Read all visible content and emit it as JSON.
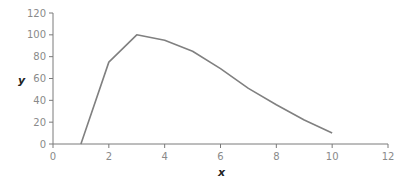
{
  "chart_data": {
    "type": "line",
    "title": "",
    "xlabel": "x",
    "ylabel": "y",
    "xlim": [
      0,
      12
    ],
    "ylim": [
      0,
      120
    ],
    "xticks": [
      0,
      2,
      4,
      6,
      8,
      10,
      12
    ],
    "yticks": [
      0,
      20,
      40,
      60,
      80,
      100,
      120
    ],
    "grid": false,
    "legend": null,
    "series": [
      {
        "name": "y",
        "color": "#808080",
        "x": [
          1,
          2,
          3,
          4,
          5,
          6,
          7,
          8,
          9,
          10
        ],
        "y": [
          0,
          75,
          100,
          95,
          85,
          69,
          51,
          36,
          22,
          10
        ]
      }
    ]
  },
  "axes": {
    "x_title": "x",
    "y_title": "y",
    "x_tick_labels": [
      "0",
      "2",
      "4",
      "6",
      "8",
      "10",
      "12"
    ],
    "y_tick_labels": [
      "0",
      "20",
      "40",
      "60",
      "80",
      "100",
      "120"
    ]
  },
  "colors": {
    "axis": "#7a7a7a",
    "line": "#808080"
  }
}
